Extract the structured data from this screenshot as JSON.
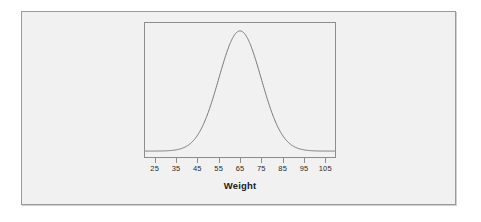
{
  "figure": {
    "background_color": "#f1f1f1",
    "frame_color": "#9a9a9a",
    "panel_border_color": "#8d8d8d",
    "curve_color": "#6b6b6b"
  },
  "chart_data": {
    "type": "line",
    "title": "",
    "subtitle": "",
    "xlabel": "Weight",
    "ylabel": "",
    "grid": false,
    "legend": null,
    "annotations": [],
    "axis": {
      "x_ticks": [
        25,
        35,
        45,
        55,
        65,
        75,
        85,
        95,
        105
      ],
      "x_tick_labels": [
        "25",
        "35",
        "45",
        "55",
        "65",
        "75",
        "85",
        "95",
        "105"
      ],
      "xlim": [
        20,
        110
      ],
      "ylim": [
        0,
        0.0435
      ],
      "y_ticks": [],
      "y_tick_labels": []
    },
    "distribution": {
      "family": "normal",
      "mean": 65,
      "sd": 10,
      "peak_x": 65,
      "peak_y": 0.0399
    },
    "series": [
      {
        "name": "Weight density",
        "x": [
          25,
          30,
          35,
          40,
          45,
          50,
          55,
          60,
          65,
          70,
          75,
          80,
          85,
          90,
          95,
          100,
          105
        ],
        "values": [
          0.0001,
          0.0004,
          0.0013,
          0.0044,
          0.0108,
          0.0221,
          0.0352,
          0.0484,
          0.0399,
          0.0484,
          0.0352,
          0.0221,
          0.0108,
          0.0044,
          0.0013,
          0.0004,
          0.0001
        ]
      }
    ]
  }
}
